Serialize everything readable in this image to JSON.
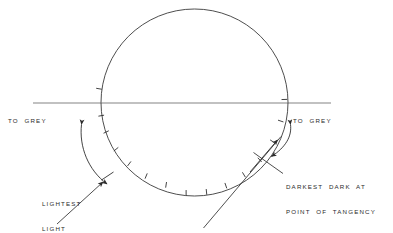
{
  "figure": {
    "type": "technical-line-diagram",
    "canvas": {
      "width": 393,
      "height": 233
    },
    "background_color": "#ffffff",
    "line_color": "#3a3a3a",
    "text_color": "#2b2b2b"
  },
  "labels": {
    "to_grey_left": "TO  GREY",
    "to_grey_right": "TO  GREY",
    "lightest_light_line1": "LIGHTEST",
    "lightest_light_line2": "LIGHT",
    "darkest_dark_line1": "DARKEST  DARK  AT",
    "darkest_dark_line2": "POINT  OF  TANGENCY"
  },
  "geometry": {
    "circle": {
      "cx": 194.5,
      "cy": 102.5,
      "r": 93.5
    },
    "horizon_line": {
      "x1": 33,
      "y1": 103,
      "x2": 331,
      "y2": 103
    },
    "tick_count": 13,
    "tick_length": 5,
    "tick_arc_start_deg": 183,
    "tick_arc_end_deg": 357
  },
  "icons": {
    "arrowhead": "triangle-arrowhead",
    "tick": "tick-mark",
    "leader": "leader-line"
  }
}
